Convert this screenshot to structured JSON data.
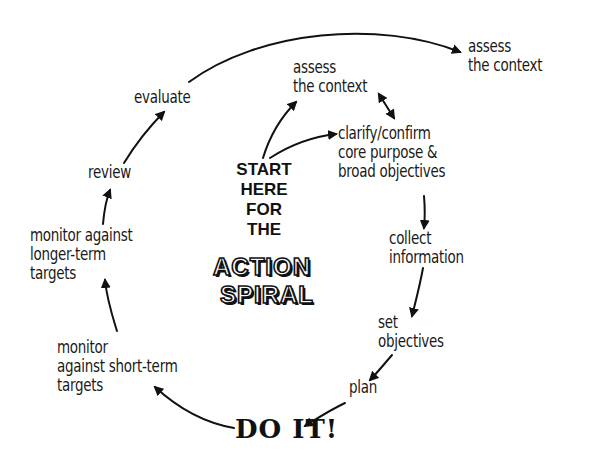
{
  "diagram": {
    "start_label": [
      "START",
      "HERE",
      "FOR",
      "THE"
    ],
    "spiral_title": [
      "ACTION",
      "SPIRAL"
    ],
    "nodes": {
      "assess_inner": "assess\nthe context",
      "clarify": "clarify/confirm\ncore purpose &\nbroad objectives",
      "collect": "collect\ninformation",
      "set_objectives": "set\nobjectives",
      "plan": "plan",
      "do_it": "DO IT!",
      "monitor_short": "monitor\nagainst short-term\ntargets",
      "monitor_long": "monitor against\nlonger-term\ntargets",
      "review": "review",
      "evaluate": "evaluate",
      "assess_outer": "assess\nthe context"
    },
    "edges": [
      {
        "from": "start",
        "to": "assess_inner"
      },
      {
        "from": "start",
        "to": "clarify"
      },
      {
        "from": "assess_inner",
        "to": "clarify",
        "bidirectional": true
      },
      {
        "from": "clarify",
        "to": "collect"
      },
      {
        "from": "collect",
        "to": "set_objectives"
      },
      {
        "from": "set_objectives",
        "to": "plan"
      },
      {
        "from": "plan",
        "to": "do_it"
      },
      {
        "from": "do_it",
        "to": "monitor_short"
      },
      {
        "from": "monitor_short",
        "to": "monitor_long"
      },
      {
        "from": "monitor_long",
        "to": "review"
      },
      {
        "from": "review",
        "to": "evaluate"
      },
      {
        "from": "evaluate",
        "to": "assess_outer"
      }
    ]
  }
}
